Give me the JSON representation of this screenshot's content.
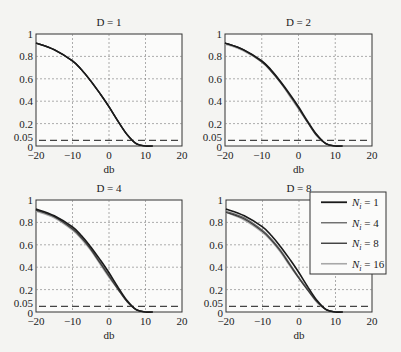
{
  "figure": {
    "width": 401,
    "height": 352
  },
  "chart_data": [
    {
      "type": "line",
      "title": "D = 1",
      "xlabel": "db",
      "ylabel": "",
      "xlim": [
        -20,
        20
      ],
      "ylim": [
        0,
        1
      ],
      "xticks": [
        "-20",
        "-10",
        "0",
        "10",
        "20"
      ],
      "yticks": [
        "0",
        "0.05",
        "0.2",
        "0.4",
        "0.6",
        "0.8",
        "1"
      ],
      "grid": true,
      "threshold": 0.05,
      "x": [
        -20,
        -15,
        -10,
        -7.5,
        -5,
        -2.5,
        0,
        2.5,
        5,
        7.5,
        10
      ],
      "series": [
        {
          "name": "Ni = 1",
          "values": [
            0.92,
            0.86,
            0.76,
            0.68,
            0.58,
            0.47,
            0.35,
            0.22,
            0.1,
            0.02,
            0.0
          ]
        },
        {
          "name": "Ni = 4",
          "values": [
            0.92,
            0.86,
            0.76,
            0.68,
            0.58,
            0.47,
            0.35,
            0.22,
            0.1,
            0.02,
            0.0
          ]
        },
        {
          "name": "Ni = 8",
          "values": [
            0.92,
            0.86,
            0.76,
            0.68,
            0.58,
            0.47,
            0.35,
            0.22,
            0.1,
            0.02,
            0.0
          ]
        },
        {
          "name": "Ni = 16",
          "values": [
            0.92,
            0.86,
            0.76,
            0.68,
            0.58,
            0.47,
            0.35,
            0.22,
            0.1,
            0.02,
            0.0
          ]
        }
      ]
    },
    {
      "type": "line",
      "title": "D = 2",
      "xlabel": "db",
      "ylabel": "",
      "xlim": [
        -20,
        20
      ],
      "ylim": [
        0,
        1
      ],
      "xticks": [
        "-20",
        "-10",
        "0",
        "10",
        "20"
      ],
      "yticks": [
        "0",
        "0.05",
        "0.2",
        "0.4",
        "0.6",
        "0.8",
        "1"
      ],
      "grid": true,
      "threshold": 0.05,
      "x": [
        -20,
        -15,
        -10,
        -7.5,
        -5,
        -2.5,
        0,
        2.5,
        5,
        7.5,
        10
      ],
      "series": [
        {
          "name": "Ni = 1",
          "values": [
            0.92,
            0.86,
            0.76,
            0.68,
            0.58,
            0.47,
            0.35,
            0.22,
            0.1,
            0.02,
            0.0
          ]
        },
        {
          "name": "Ni = 4",
          "values": [
            0.92,
            0.86,
            0.76,
            0.68,
            0.58,
            0.46,
            0.34,
            0.21,
            0.1,
            0.02,
            0.0
          ]
        },
        {
          "name": "Ni = 8",
          "values": [
            0.92,
            0.86,
            0.75,
            0.67,
            0.57,
            0.46,
            0.34,
            0.21,
            0.09,
            0.02,
            0.0
          ]
        },
        {
          "name": "Ni = 16",
          "values": [
            0.91,
            0.85,
            0.75,
            0.67,
            0.57,
            0.45,
            0.33,
            0.21,
            0.09,
            0.02,
            0.0
          ]
        }
      ]
    },
    {
      "type": "line",
      "title": "D = 4",
      "xlabel": "db",
      "ylabel": "",
      "xlim": [
        -20,
        20
      ],
      "ylim": [
        0,
        1
      ],
      "xticks": [
        "-20",
        "-10",
        "0",
        "10",
        "20"
      ],
      "yticks": [
        "0",
        "0.05",
        "0.2",
        "0.4",
        "0.6",
        "0.8",
        "1"
      ],
      "grid": true,
      "threshold": 0.05,
      "x": [
        -20,
        -15,
        -10,
        -7.5,
        -5,
        -2.5,
        0,
        2.5,
        5,
        7.5,
        10
      ],
      "series": [
        {
          "name": "Ni = 1",
          "values": [
            0.92,
            0.86,
            0.76,
            0.68,
            0.58,
            0.47,
            0.35,
            0.22,
            0.1,
            0.02,
            0.0
          ]
        },
        {
          "name": "Ni = 4",
          "values": [
            0.91,
            0.85,
            0.75,
            0.67,
            0.57,
            0.45,
            0.33,
            0.21,
            0.09,
            0.02,
            0.0
          ]
        },
        {
          "name": "Ni = 8",
          "values": [
            0.91,
            0.85,
            0.74,
            0.66,
            0.56,
            0.44,
            0.32,
            0.2,
            0.09,
            0.02,
            0.0
          ]
        },
        {
          "name": "Ni = 16",
          "values": [
            0.9,
            0.84,
            0.73,
            0.65,
            0.55,
            0.43,
            0.31,
            0.2,
            0.09,
            0.02,
            0.0
          ]
        }
      ]
    },
    {
      "type": "line",
      "title": "D = 8",
      "xlabel": "db",
      "ylabel": "",
      "xlim": [
        -20,
        20
      ],
      "ylim": [
        0,
        1
      ],
      "xticks": [
        "-20",
        "-10",
        "0",
        "10",
        "20"
      ],
      "yticks": [
        "0",
        "0.05",
        "0.2",
        "0.4",
        "0.6",
        "0.8",
        "1"
      ],
      "grid": true,
      "threshold": 0.05,
      "x": [
        -20,
        -15,
        -10,
        -7.5,
        -5,
        -2.5,
        0,
        2.5,
        5,
        7.5,
        10
      ],
      "series": [
        {
          "name": "Ni = 1",
          "values": [
            0.92,
            0.86,
            0.76,
            0.68,
            0.58,
            0.47,
            0.35,
            0.22,
            0.1,
            0.02,
            0.0
          ]
        },
        {
          "name": "Ni = 4",
          "values": [
            0.9,
            0.84,
            0.73,
            0.65,
            0.55,
            0.43,
            0.31,
            0.2,
            0.09,
            0.02,
            0.0
          ]
        },
        {
          "name": "Ni = 8",
          "values": [
            0.89,
            0.83,
            0.72,
            0.64,
            0.54,
            0.42,
            0.3,
            0.19,
            0.09,
            0.02,
            0.0
          ]
        },
        {
          "name": "Ni = 16",
          "values": [
            0.89,
            0.82,
            0.71,
            0.63,
            0.53,
            0.41,
            0.3,
            0.19,
            0.08,
            0.02,
            0.0
          ]
        }
      ],
      "legend": {
        "position": "upper right",
        "entries": [
          {
            "label_var": "N",
            "label_sub": "i",
            "label_rest": " = 1"
          },
          {
            "label_var": "N",
            "label_sub": "i",
            "label_rest": " = 4"
          },
          {
            "label_var": "N",
            "label_sub": "i",
            "label_rest": " = 8"
          },
          {
            "label_var": "N",
            "label_sub": "i",
            "label_rest": " = 16"
          }
        ]
      }
    }
  ],
  "series_colors": [
    "#1a1a1a",
    "#6a6a6a",
    "#3a3a3a",
    "#a8a8a8"
  ],
  "series_widths": [
    1.6,
    1.2,
    1.2,
    1.4
  ],
  "panels": [
    {
      "left": 36,
      "top": 34,
      "right": 182,
      "bottom": 146
    },
    {
      "left": 225,
      "top": 34,
      "right": 372,
      "bottom": 146
    },
    {
      "left": 36,
      "top": 200,
      "right": 182,
      "bottom": 312
    },
    {
      "left": 226,
      "top": 200,
      "right": 372,
      "bottom": 312
    }
  ],
  "legend_box": {
    "left": 310,
    "top": 192,
    "right": 386,
    "bottom": 274
  }
}
